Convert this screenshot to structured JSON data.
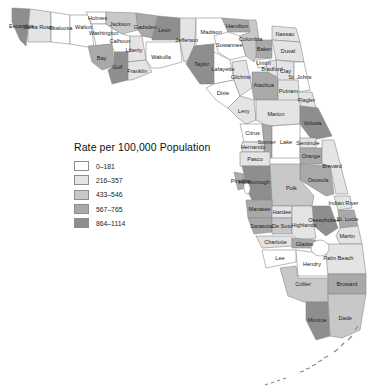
{
  "legend": {
    "title": "Rate per 100,000 Population",
    "classes": [
      {
        "label": "0–181",
        "color": "#ffffff"
      },
      {
        "label": "216–357",
        "color": "#e4e4e4"
      },
      {
        "label": "433–546",
        "color": "#c8c8c8"
      },
      {
        "label": "567–765",
        "color": "#a9a9a9"
      },
      {
        "label": "864–1114",
        "color": "#8e8e8e"
      }
    ]
  },
  "counties": [
    {
      "name": "Escambia",
      "class": 4
    },
    {
      "name": "Santa Rosa",
      "class": 1
    },
    {
      "name": "Okaloosa",
      "class": 0
    },
    {
      "name": "Walton",
      "class": 0
    },
    {
      "name": "Holmes",
      "class": 0
    },
    {
      "name": "Washington",
      "class": 0
    },
    {
      "name": "Jackson",
      "class": 2
    },
    {
      "name": "Bay",
      "class": 3
    },
    {
      "name": "Calhoun",
      "class": 0
    },
    {
      "name": "Gulf",
      "class": 4
    },
    {
      "name": "Liberty",
      "class": 1
    },
    {
      "name": "Franklin",
      "class": 1
    },
    {
      "name": "Gadsden",
      "class": 3
    },
    {
      "name": "Leon",
      "class": 4
    },
    {
      "name": "Wakulla",
      "class": 0
    },
    {
      "name": "Jefferson",
      "class": 1
    },
    {
      "name": "Madison",
      "class": 0
    },
    {
      "name": "Taylor",
      "class": 4
    },
    {
      "name": "Hamilton",
      "class": 3
    },
    {
      "name": "Suwannee",
      "class": 0
    },
    {
      "name": "Columbia",
      "class": 2
    },
    {
      "name": "Lafayette",
      "class": 0
    },
    {
      "name": "Dixie",
      "class": 0
    },
    {
      "name": "Gilchrist",
      "class": 1
    },
    {
      "name": "Union",
      "class": 0
    },
    {
      "name": "Baker",
      "class": 3
    },
    {
      "name": "Bradford",
      "class": 1
    },
    {
      "name": "Nassau",
      "class": 1
    },
    {
      "name": "Duval",
      "class": 1
    },
    {
      "name": "Clay",
      "class": 1
    },
    {
      "name": "St. Johns",
      "class": 0
    },
    {
      "name": "Alachua",
      "class": 3
    },
    {
      "name": "Putnam",
      "class": 1
    },
    {
      "name": "Flagler",
      "class": 1
    },
    {
      "name": "Levy",
      "class": 1
    },
    {
      "name": "Marion",
      "class": 1
    },
    {
      "name": "Volusia",
      "class": 4
    },
    {
      "name": "Citrus",
      "class": 0
    },
    {
      "name": "Sumter",
      "class": 3
    },
    {
      "name": "Lake",
      "class": 0
    },
    {
      "name": "Seminole",
      "class": 1
    },
    {
      "name": "Hernando",
      "class": 1
    },
    {
      "name": "Pasco",
      "class": 1
    },
    {
      "name": "Orange",
      "class": 3
    },
    {
      "name": "Brevard",
      "class": 1
    },
    {
      "name": "Osceola",
      "class": 3
    },
    {
      "name": "Hillsborough",
      "class": 4
    },
    {
      "name": "Pinellas",
      "class": 3
    },
    {
      "name": "Polk",
      "class": 2
    },
    {
      "name": "Indian River",
      "class": 1
    },
    {
      "name": "Manatee",
      "class": 3
    },
    {
      "name": "Hardee",
      "class": 1
    },
    {
      "name": "Okeechobee",
      "class": 4
    },
    {
      "name": "St. Lucie",
      "class": 3
    },
    {
      "name": "Sarasota",
      "class": 3
    },
    {
      "name": "De Soto",
      "class": 2
    },
    {
      "name": "Highlands",
      "class": 1
    },
    {
      "name": "Martin",
      "class": 1
    },
    {
      "name": "Charlotte",
      "class": 1
    },
    {
      "name": "Glades",
      "class": 3
    },
    {
      "name": "Palm Beach",
      "class": 1
    },
    {
      "name": "Lee",
      "class": 0
    },
    {
      "name": "Hendry",
      "class": 0
    },
    {
      "name": "Collier",
      "class": 2
    },
    {
      "name": "Broward",
      "class": 3
    },
    {
      "name": "Monroe",
      "class": 4
    },
    {
      "name": "Dade",
      "class": 2
    }
  ]
}
